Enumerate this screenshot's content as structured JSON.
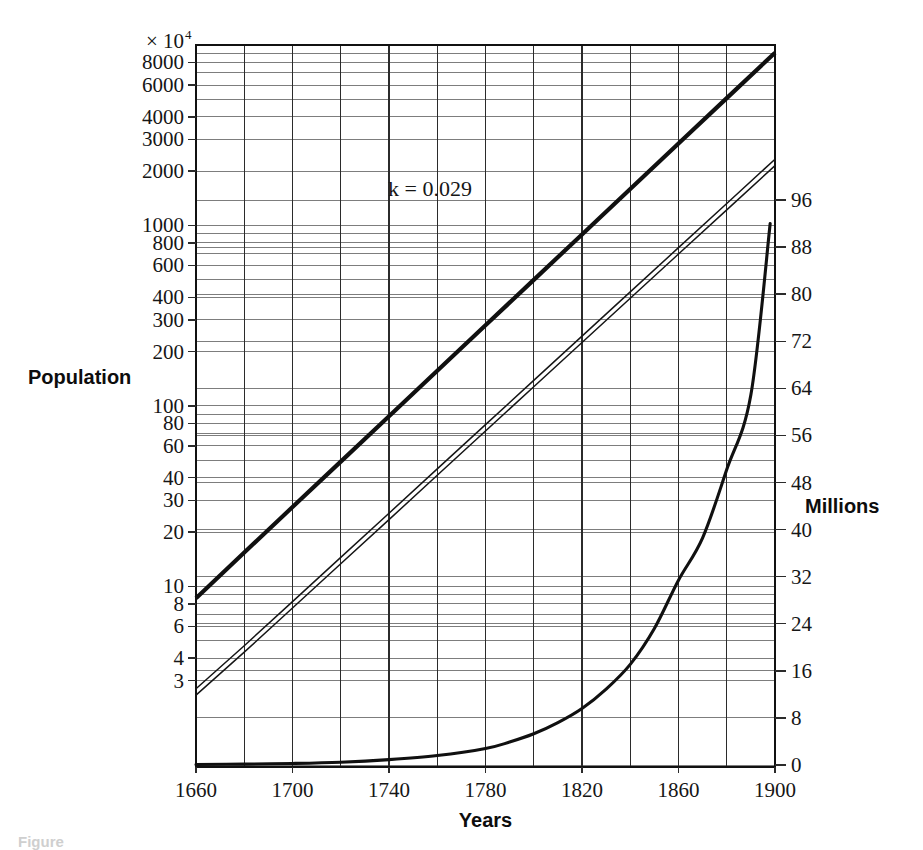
{
  "figure": {
    "caption_partial": "Figure",
    "background": "#ffffff",
    "ink": "#161616"
  },
  "axes": {
    "left": {
      "title": "Population",
      "exponent_prefix": "× 10",
      "exponent_power": "4",
      "scale": "log",
      "tick_labels": [
        "8000",
        "6000",
        "4000",
        "3000",
        "2000",
        "1000",
        "800",
        "600",
        "400",
        "300",
        "200",
        "100",
        "80",
        "60",
        "40",
        "30",
        "20",
        "10",
        "8",
        "6",
        "4",
        "3"
      ],
      "range": [
        2.5,
        10000
      ]
    },
    "right": {
      "title": "Millions",
      "scale": "linear",
      "tick_labels": [
        "96",
        "88",
        "80",
        "72",
        "64",
        "56",
        "48",
        "40",
        "32",
        "24",
        "16",
        "8",
        "0"
      ],
      "tick_values": [
        96,
        88,
        80,
        72,
        64,
        56,
        48,
        40,
        32,
        24,
        16,
        8,
        0
      ],
      "range": [
        0,
        96
      ]
    },
    "bottom": {
      "title": "Years",
      "tick_labels": [
        "1660",
        "1700",
        "1740",
        "1780",
        "1820",
        "1860",
        "1900"
      ],
      "tick_values": [
        1660,
        1700,
        1740,
        1780,
        1820,
        1860,
        1900
      ],
      "range": [
        1660,
        1900
      ]
    }
  },
  "annotations": [
    {
      "id": "growth-rate",
      "text": "k — 0.029",
      "display": "k = 0.029",
      "x_year": 1757,
      "y_screen": 196
    }
  ],
  "chart_data": {
    "type": "line",
    "title": "",
    "subtitle": "",
    "xlabel": "Years",
    "ylabel": "Population",
    "y2label": "Millions",
    "xlim": [
      1660,
      1900
    ],
    "ylim_log": [
      2.5,
      10000
    ],
    "ylim_linear": [
      0,
      96
    ],
    "log_y_axis": true,
    "grid": true,
    "legend": "none",
    "series": [
      {
        "name": "Exponential model (log scale, k = 0.029)",
        "style": "thick-solid",
        "axis": "left-log",
        "x": [
          1660,
          1680,
          1700,
          1720,
          1740,
          1760,
          1780,
          1800,
          1820,
          1840,
          1860,
          1880,
          1900
        ],
        "values": [
          8.6,
          15.4,
          27.5,
          49.1,
          87.7,
          156.6,
          279.6,
          499.4,
          891.8,
          1592.5,
          2843.7,
          5078.4,
          9068.6
        ]
      },
      {
        "name": "Actual population (log scale, double line)",
        "style": "thin-double",
        "axis": "left-log",
        "x": [
          1660,
          1680,
          1700,
          1720,
          1740,
          1760,
          1780,
          1800,
          1820,
          1840,
          1860,
          1880,
          1900
        ],
        "values": [
          2.6,
          4.5,
          7.9,
          13.9,
          24.4,
          43.0,
          75.6,
          133.0,
          233.8,
          411.1,
          723.0,
          1271.3,
          2235.5
        ]
      },
      {
        "name": "U.S. population (linear scale, millions)",
        "style": "medium-solid",
        "axis": "right-linear",
        "x": [
          1660,
          1680,
          1700,
          1720,
          1740,
          1760,
          1780,
          1790,
          1800,
          1810,
          1820,
          1830,
          1840,
          1850,
          1860,
          1870,
          1880,
          1890,
          1898
        ],
        "values": [
          0.08,
          0.15,
          0.26,
          0.47,
          0.91,
          1.6,
          2.8,
          3.9,
          5.3,
          7.2,
          9.6,
          12.9,
          17.1,
          23.2,
          31.4,
          38.6,
          50.2,
          62.9,
          92.0
        ]
      }
    ]
  }
}
